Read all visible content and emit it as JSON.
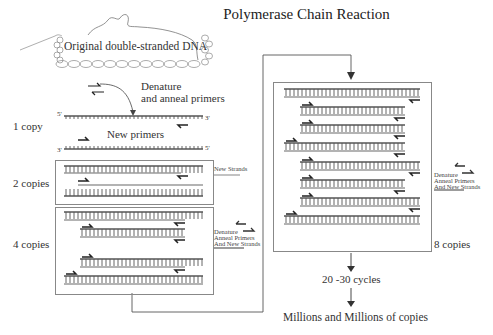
{
  "title": "Polymerase Chain Reaction",
  "labels": {
    "original_dna": "Original double-stranded DNA",
    "denature_line1": "Denature",
    "denature_line2": "and anneal primers",
    "new_primers": "New primers",
    "five_prime": "5'",
    "three_prime": "3'",
    "cycles": "20 -30 cycles",
    "result": "Millions and Millions of copies"
  },
  "stages": [
    {
      "label": "1 copy",
      "strands": 2
    },
    {
      "label": "2 copies",
      "strands": 2
    },
    {
      "label": "4 copies",
      "strands": 4
    },
    {
      "label": "8 copies",
      "strands": 8
    }
  ],
  "legends": {
    "new_strands": "New Strands",
    "denature_small_1": "Denature",
    "denature_small_2": "Anneal Primers",
    "denature_small_3": "And New Strands"
  },
  "colors": {
    "strand": "#555555",
    "new_strand": "#9a9a9a",
    "primer": "#222222",
    "box_border": "#888888"
  }
}
